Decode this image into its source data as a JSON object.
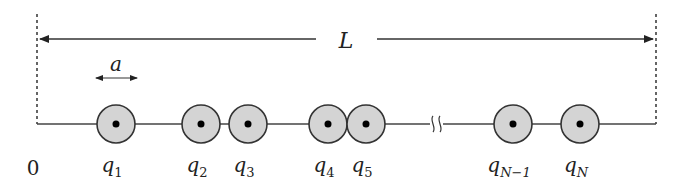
{
  "diagram": {
    "length_label": "L",
    "spacing_label": "a",
    "origin_label": "0",
    "colors": {
      "line": "#3a3a3a",
      "circle_fill": "#d4d4d4",
      "circle_stroke": "#333333",
      "dot": "#000000"
    },
    "charges": [
      {
        "symbol": "q",
        "sub": "1",
        "x": 116
      },
      {
        "symbol": "q",
        "sub": "2",
        "x": 201
      },
      {
        "symbol": "q",
        "sub": "3",
        "x": 248
      },
      {
        "symbol": "q",
        "sub": "4",
        "x": 328
      },
      {
        "symbol": "q",
        "sub": "5",
        "x": 366
      },
      {
        "symbol": "q",
        "sub": "N−1",
        "x": 513
      },
      {
        "symbol": "q",
        "sub": "N",
        "x": 580
      }
    ],
    "break_marker": "≈"
  }
}
